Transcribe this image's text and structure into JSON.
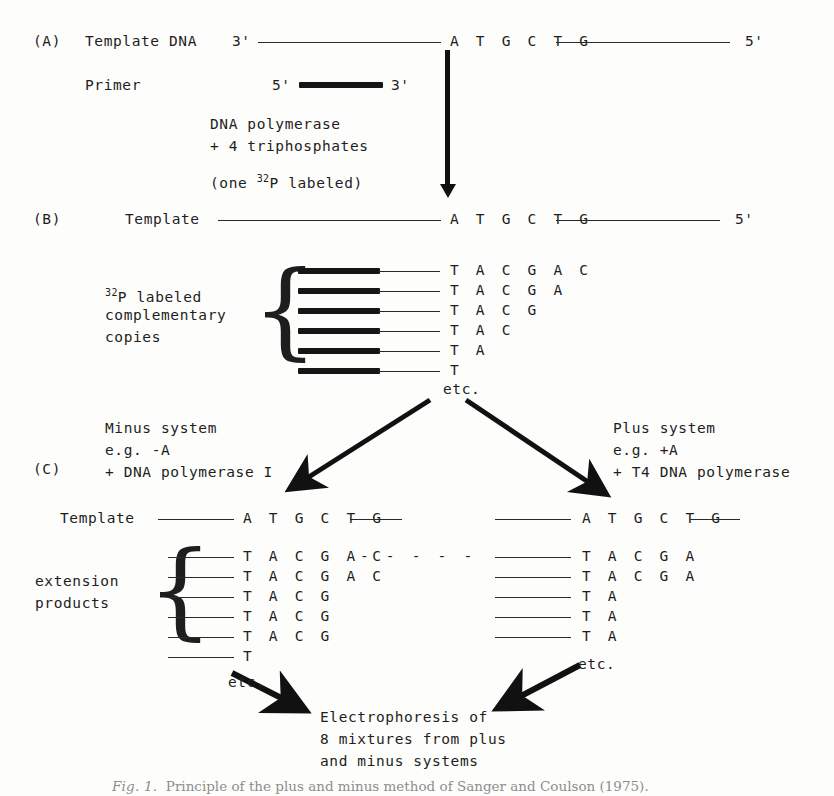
{
  "figure": {
    "panels": {
      "a_label": "(A)",
      "b_label": "(B)",
      "c_label": "(C)"
    },
    "panel_a": {
      "template_label": "Template DNA",
      "primer_label": "Primer",
      "template_five_prime": "3'",
      "template_three_prime": "5'",
      "template_sequence": "A T G C T G",
      "primer_left_end": "5'",
      "primer_right_end": "3'",
      "reaction_lines": [
        "DNA polymerase",
        "+ 4 triphosphates"
      ],
      "label_note_prefix": "(one ",
      "label_note_isotope_sup": "32",
      "label_note_isotope_base": "P",
      "label_note_suffix": " labeled)"
    },
    "panel_b": {
      "template_label": "Template",
      "template_sequence": "A T G C T G",
      "template_three_prime": "5'",
      "copies_label_isotope_sup": "32",
      "copies_label_isotope_base": "P",
      "copies_label_rest": " labeled",
      "copies_label_line2": "complementary",
      "copies_label_line3": "copies",
      "copies": [
        "T A C G A C",
        "T A C G A",
        "T A C G",
        "T A C",
        "T A",
        "T"
      ],
      "etc": "etc."
    },
    "panel_c": {
      "minus_branch": {
        "lines": [
          "Minus system",
          "e.g. -A",
          "+ DNA polymerase I"
        ],
        "template_label": "Template",
        "template_sequence": "A T G C T G",
        "products_label_line1": "extension",
        "products_label_line2": "products",
        "products": [
          "T A C G A C",
          "T A C G A C",
          "T A C G",
          "T A C G",
          "T A C G",
          "T"
        ],
        "first_product_has_dashes": true,
        "dashes": "- - - - -",
        "etc": "etc."
      },
      "plus_branch": {
        "lines": [
          "Plus system",
          "e.g. +A",
          "+ T4 DNA polymerase"
        ],
        "template_sequence": "A T G C T G",
        "products": [
          "T A C G A",
          "T A C G A",
          "T A",
          "T A",
          "T A"
        ],
        "etc": "etc."
      }
    },
    "outcome": {
      "lines": [
        "Electrophoresis of",
        "8 mixtures from plus",
        "and minus systems"
      ]
    },
    "caption": {
      "figure_number": "Fig. 1.",
      "text": "Principle of the plus and minus method of Sanger and Coulson (1975)."
    }
  },
  "colors": {
    "ink": "#1e1e1e",
    "bar": "#161616",
    "paper": "#fdfdfb",
    "caption": "#2b2b2b"
  }
}
